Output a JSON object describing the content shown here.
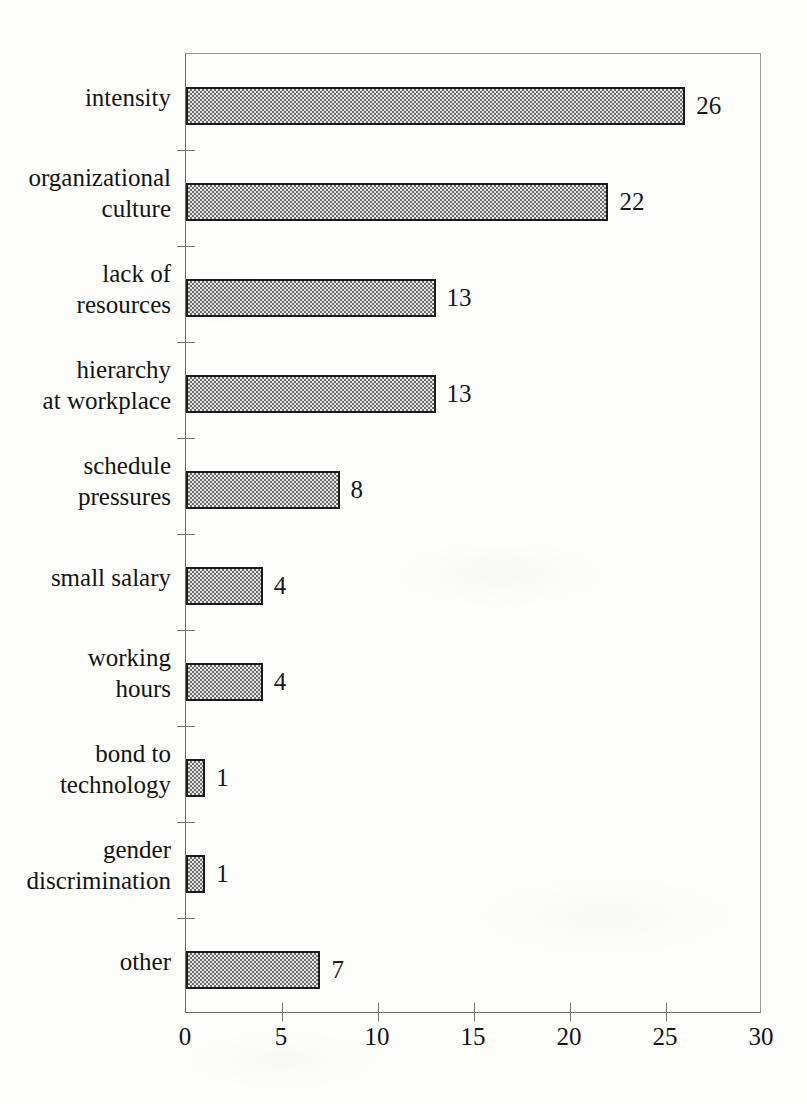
{
  "chart_data": {
    "type": "bar",
    "orientation": "horizontal",
    "title": "",
    "xlabel": "",
    "ylabel": "",
    "xlim": [
      0,
      30
    ],
    "xticks": [
      0,
      5,
      10,
      15,
      20,
      25,
      30
    ],
    "grid": false,
    "legend": false,
    "bar_fill": "#a8a8a8",
    "bar_edge": "#1b1b1b",
    "categories": [
      "intensity",
      "organizational culture",
      "lack of resources",
      "hierarchy at workplace",
      "schedule pressures",
      "small salary",
      "working hours",
      "bond to technology",
      "gender discrimination",
      "other"
    ],
    "category_lines": [
      [
        "intensity"
      ],
      [
        "organizational",
        "culture"
      ],
      [
        "lack of",
        "resources"
      ],
      [
        "hierarchy",
        "at workplace"
      ],
      [
        "schedule",
        "pressures"
      ],
      [
        "small salary"
      ],
      [
        "working",
        "hours"
      ],
      [
        "bond to",
        "technology"
      ],
      [
        "gender",
        "discrimination"
      ],
      [
        "other"
      ]
    ],
    "values": [
      26,
      22,
      13,
      13,
      8,
      4,
      4,
      1,
      1,
      7
    ],
    "value_labels": [
      "26",
      "22",
      "13",
      "13",
      "8",
      "4",
      "4",
      "1",
      "1",
      "7"
    ]
  }
}
